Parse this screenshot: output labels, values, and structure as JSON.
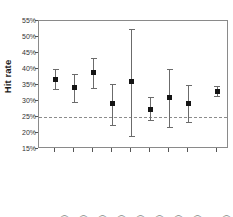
{
  "chart_data": {
    "type": "scatter",
    "title": "",
    "xlabel": "",
    "ylabel": "Hit rate",
    "ylim": [
      15,
      55
    ],
    "ytick_labels": [
      "55%",
      "50%",
      "45%",
      "40%",
      "35%",
      "30%",
      "25%",
      "20%",
      "15%"
    ],
    "ytick_values": [
      55,
      50,
      45,
      40,
      35,
      30,
      25,
      20,
      15
    ],
    "grid": false,
    "legend": "none",
    "reference_line": {
      "value": 25,
      "label": "25%",
      "style": "dashed"
    },
    "categories": [
      "BS MA (762)",
      "PRL (355)",
      "Edinburgh (289)",
      "Amsterdam (164)",
      "Cornell (25)",
      "Rhine Center (590)",
      "Gothenburg (90)",
      "Utrecht (232)",
      "All studies (2549)"
    ],
    "values": [
      36.7,
      34.3,
      39.0,
      29.2,
      36.0,
      27.5,
      31.0,
      29.2,
      33.0
    ],
    "error_low": [
      33.8,
      29.7,
      34.1,
      22.4,
      19.0,
      24.1,
      22.0,
      23.5,
      31.5
    ],
    "error_high": [
      40.0,
      38.5,
      43.5,
      35.3,
      52.5,
      31.1,
      40.0,
      35.0,
      34.6
    ],
    "series": [
      {
        "name": "Hit rate with 95% confidence interval",
        "points": [
          {
            "category": "BS MA (762)",
            "value": 36.7,
            "low": 33.8,
            "high": 40.0
          },
          {
            "category": "PRL (355)",
            "value": 34.3,
            "low": 29.7,
            "high": 38.5
          },
          {
            "category": "Edinburgh (289)",
            "value": 39.0,
            "low": 34.1,
            "high": 43.5
          },
          {
            "category": "Amsterdam (164)",
            "value": 29.2,
            "low": 22.4,
            "high": 35.3
          },
          {
            "category": "Cornell (25)",
            "value": 36.0,
            "low": 19.0,
            "high": 52.5
          },
          {
            "category": "Rhine Center (590)",
            "value": 27.5,
            "low": 24.1,
            "high": 31.1
          },
          {
            "category": "Gothenburg (90)",
            "value": 31.0,
            "low": 22.0,
            "high": 40.0
          },
          {
            "category": "Utrecht (232)",
            "value": 29.2,
            "low": 23.5,
            "high": 35.0
          },
          {
            "category": "All studies (2549)",
            "value": 33.0,
            "low": 31.5,
            "high": 34.6
          }
        ]
      }
    ],
    "category_positions": [
      0.085,
      0.185,
      0.285,
      0.385,
      0.485,
      0.585,
      0.685,
      0.785,
      0.935
    ],
    "colors": {
      "marker": "#141414",
      "whisker": "#6b6b6b",
      "frame": "#8a8a8a",
      "reference": "#8c8c8c",
      "text": "#2b2b2b"
    }
  }
}
